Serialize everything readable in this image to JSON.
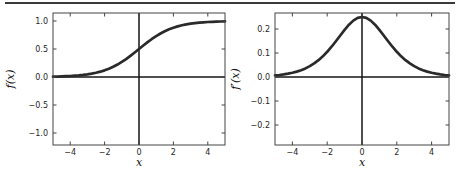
{
  "figure": {
    "background": "#ffffff",
    "top_rule_color": "#3a3a3a",
    "axis_color": "#444444",
    "zero_line_color": "#141414",
    "tick_label_color": "#1f1f1f",
    "axis_label_color": "#111111"
  },
  "chart_data": [
    {
      "type": "line",
      "title": "",
      "xlabel": "x",
      "ylabel": "f(x)",
      "xlim": [
        -5,
        5
      ],
      "ylim": [
        -1.214,
        1.143
      ],
      "grid": false,
      "legend": false,
      "zero_lines": true,
      "line_color": "#2a2a2a",
      "x_ticks": {
        "values": [
          -4,
          -2,
          0,
          2,
          4
        ],
        "labels": [
          "−4",
          "−2",
          "0",
          "2",
          "4"
        ]
      },
      "y_ticks": {
        "values": [
          1.0,
          0.5,
          0.0,
          -0.5,
          -1.0
        ],
        "labels": [
          "1.0",
          "0.5",
          "0.0",
          "−0.5",
          "−1.0"
        ]
      },
      "series": [
        {
          "name": "sigmoid",
          "x": [
            -5,
            -4.75,
            -4.5,
            -4.25,
            -4,
            -3.75,
            -3.5,
            -3.25,
            -3,
            -2.75,
            -2.5,
            -2.25,
            -2,
            -1.75,
            -1.5,
            -1.25,
            -1,
            -0.75,
            -0.5,
            -0.25,
            0,
            0.25,
            0.5,
            0.75,
            1,
            1.25,
            1.5,
            1.75,
            2,
            2.25,
            2.5,
            2.75,
            3,
            3.25,
            3.5,
            3.75,
            4,
            4.25,
            4.5,
            4.75,
            5
          ],
          "y": [
            0.0067,
            0.0086,
            0.011,
            0.0141,
            0.018,
            0.023,
            0.0293,
            0.0373,
            0.0474,
            0.0601,
            0.0759,
            0.0953,
            0.1192,
            0.148,
            0.1824,
            0.2227,
            0.2689,
            0.3208,
            0.3775,
            0.4378,
            0.5,
            0.5622,
            0.6225,
            0.6792,
            0.7311,
            0.7773,
            0.8176,
            0.852,
            0.8808,
            0.9047,
            0.9241,
            0.9399,
            0.9526,
            0.9627,
            0.9707,
            0.977,
            0.982,
            0.9859,
            0.989,
            0.9914,
            0.9933
          ]
        }
      ]
    },
    {
      "type": "line",
      "title": "",
      "xlabel": "x",
      "ylabel": "f′(x)",
      "xlim": [
        -5,
        5
      ],
      "ylim": [
        -0.2833,
        0.2667
      ],
      "grid": false,
      "legend": false,
      "zero_lines": true,
      "line_color": "#2a2a2a",
      "x_ticks": {
        "values": [
          -4,
          -2,
          0,
          2,
          4
        ],
        "labels": [
          "−4",
          "−2",
          "0",
          "2",
          "4"
        ]
      },
      "y_ticks": {
        "values": [
          0.2,
          0.1,
          0.0,
          -0.1,
          -0.2
        ],
        "labels": [
          "0.2",
          "0.1",
          "0.0",
          "−0.1",
          "−0.2"
        ]
      },
      "series": [
        {
          "name": "sigmoid-derivative",
          "x": [
            -5,
            -4.75,
            -4.5,
            -4.25,
            -4,
            -3.75,
            -3.5,
            -3.25,
            -3,
            -2.75,
            -2.5,
            -2.25,
            -2,
            -1.75,
            -1.5,
            -1.25,
            -1,
            -0.75,
            -0.5,
            -0.25,
            0,
            0.25,
            0.5,
            0.75,
            1,
            1.25,
            1.5,
            1.75,
            2,
            2.25,
            2.5,
            2.75,
            3,
            3.25,
            3.5,
            3.75,
            4,
            4.25,
            4.5,
            4.75,
            5
          ],
          "y": [
            0.0066,
            0.0085,
            0.0109,
            0.0139,
            0.0177,
            0.0225,
            0.0284,
            0.0359,
            0.0452,
            0.0565,
            0.0701,
            0.0862,
            0.105,
            0.1261,
            0.1491,
            0.1731,
            0.1966,
            0.2179,
            0.235,
            0.2461,
            0.25,
            0.2461,
            0.235,
            0.2179,
            0.1966,
            0.1731,
            0.1491,
            0.1261,
            0.105,
            0.0862,
            0.0701,
            0.0565,
            0.0452,
            0.0359,
            0.0284,
            0.0225,
            0.0177,
            0.0139,
            0.0109,
            0.0085,
            0.0066
          ]
        }
      ]
    }
  ]
}
